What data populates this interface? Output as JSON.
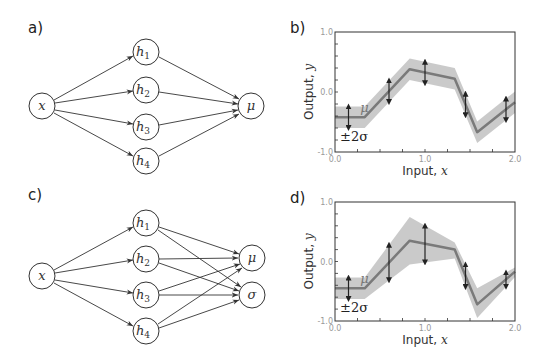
{
  "panels": {
    "a": {
      "label": "a)"
    },
    "b": {
      "label": "b)"
    },
    "c": {
      "label": "c)"
    },
    "d": {
      "label": "d)"
    }
  },
  "nodes": {
    "x": "x",
    "h": "h",
    "h1_sub": "1",
    "h2_sub": "2",
    "h3_sub": "3",
    "h4_sub": "4",
    "mu": "μ",
    "sigma": "σ"
  },
  "plot_labels": {
    "xlabel_text": "Input, ",
    "xlabel_var": "x",
    "ylabel_text": "Output, ",
    "ylabel_var": "y",
    "mu_annotation": "μ",
    "sigma_annotation": "±2σ",
    "xticks": [
      "0.0",
      "1.0",
      "2.0"
    ],
    "yticks": [
      "1.0",
      "0.0",
      "-1.0"
    ]
  },
  "chart_data": [
    {
      "panel": "b",
      "type": "line",
      "title": "",
      "xlabel": "Input, x",
      "ylabel": "Output, y",
      "xlim": [
        0,
        2
      ],
      "ylim": [
        -1,
        1
      ],
      "series": [
        {
          "name": "μ (mean)",
          "x": [
            0.0,
            0.33,
            0.83,
            1.33,
            1.58,
            2.0
          ],
          "values": [
            -0.42,
            -0.42,
            0.38,
            0.22,
            -0.67,
            -0.17
          ]
        },
        {
          "name": "±2σ upper",
          "x": [
            0.0,
            0.33,
            0.83,
            1.33,
            1.58,
            2.0
          ],
          "values": [
            -0.24,
            -0.24,
            0.56,
            0.4,
            -0.49,
            0.01
          ]
        },
        {
          "name": "±2σ lower",
          "x": [
            0.0,
            0.33,
            0.83,
            1.33,
            1.58,
            2.0
          ],
          "values": [
            -0.6,
            -0.6,
            0.2,
            0.04,
            -0.85,
            -0.35
          ]
        }
      ],
      "error_bars_x": [
        0.15,
        0.6,
        1.0,
        1.45,
        1.9
      ],
      "annotations": [
        "μ",
        "±2σ"
      ]
    },
    {
      "panel": "d",
      "type": "line",
      "title": "",
      "xlabel": "Input, x",
      "ylabel": "Output, y",
      "xlim": [
        0,
        2
      ],
      "ylim": [
        -1,
        1
      ],
      "series": [
        {
          "name": "μ (mean)",
          "x": [
            0.0,
            0.33,
            0.83,
            1.33,
            1.58,
            2.0
          ],
          "values": [
            -0.45,
            -0.45,
            0.35,
            0.2,
            -0.72,
            -0.17
          ]
        },
        {
          "name": "±2σ upper",
          "x": [
            0.0,
            0.33,
            0.83,
            1.33,
            1.58,
            2.0
          ],
          "values": [
            -0.27,
            -0.27,
            0.75,
            0.32,
            -0.45,
            -0.1
          ]
        },
        {
          "name": "±2σ lower",
          "x": [
            0.0,
            0.33,
            0.83,
            1.33,
            1.58,
            2.0
          ],
          "values": [
            -0.63,
            -0.63,
            -0.05,
            0.05,
            -0.95,
            -0.26
          ]
        }
      ],
      "error_bars_x": [
        0.15,
        0.6,
        1.0,
        1.45,
        1.9
      ],
      "annotations": [
        "μ",
        "±2σ"
      ]
    }
  ]
}
